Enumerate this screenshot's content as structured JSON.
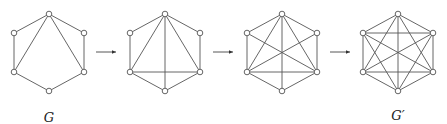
{
  "diagram": {
    "vertex_offsets": {
      "top": [
        0,
        -39
      ],
      "ul": [
        -35,
        -20
      ],
      "ll": [
        -35,
        19
      ],
      "bottom": [
        0,
        38
      ],
      "lr": [
        35,
        19
      ],
      "ur": [
        35,
        -20
      ]
    },
    "graphs": [
      {
        "id": "G",
        "label": "G",
        "center": [
          49,
          53
        ],
        "edges": [
          [
            "top",
            "ul"
          ],
          [
            "ul",
            "ll"
          ],
          [
            "ll",
            "bottom"
          ],
          [
            "bottom",
            "lr"
          ],
          [
            "lr",
            "ur"
          ],
          [
            "ur",
            "top"
          ],
          [
            "top",
            "ll"
          ],
          [
            "top",
            "lr"
          ]
        ]
      },
      {
        "id": "step1",
        "label": "",
        "center": [
          165,
          53
        ],
        "edges": [
          [
            "top",
            "ul"
          ],
          [
            "ul",
            "ll"
          ],
          [
            "ll",
            "bottom"
          ],
          [
            "bottom",
            "lr"
          ],
          [
            "lr",
            "ur"
          ],
          [
            "ur",
            "top"
          ],
          [
            "top",
            "ll"
          ],
          [
            "top",
            "lr"
          ],
          [
            "top",
            "bottom"
          ],
          [
            "ll",
            "lr"
          ]
        ]
      },
      {
        "id": "step2",
        "label": "",
        "center": [
          282,
          53
        ],
        "edges": [
          [
            "top",
            "ul"
          ],
          [
            "ul",
            "ll"
          ],
          [
            "ll",
            "bottom"
          ],
          [
            "bottom",
            "lr"
          ],
          [
            "lr",
            "ur"
          ],
          [
            "ur",
            "top"
          ],
          [
            "top",
            "ll"
          ],
          [
            "top",
            "lr"
          ],
          [
            "top",
            "bottom"
          ],
          [
            "ll",
            "lr"
          ],
          [
            "ul",
            "lr"
          ],
          [
            "ur",
            "ll"
          ]
        ]
      },
      {
        "id": "G_prime",
        "label": "G′",
        "center": [
          398,
          53
        ],
        "edges": [
          [
            "top",
            "ul"
          ],
          [
            "ul",
            "ll"
          ],
          [
            "ll",
            "bottom"
          ],
          [
            "bottom",
            "lr"
          ],
          [
            "lr",
            "ur"
          ],
          [
            "ur",
            "top"
          ],
          [
            "top",
            "ll"
          ],
          [
            "top",
            "lr"
          ],
          [
            "top",
            "bottom"
          ],
          [
            "ll",
            "lr"
          ],
          [
            "ul",
            "lr"
          ],
          [
            "ur",
            "ll"
          ],
          [
            "ul",
            "ur"
          ],
          [
            "ul",
            "bottom"
          ],
          [
            "ur",
            "bottom"
          ]
        ]
      }
    ],
    "arrows": [
      {
        "from": [
          96,
          52
        ],
        "to": [
          116,
          52
        ]
      },
      {
        "from": [
          213,
          52
        ],
        "to": [
          233,
          52
        ]
      },
      {
        "from": [
          330,
          52
        ],
        "to": [
          350,
          52
        ]
      }
    ],
    "labels": [
      {
        "text": "G",
        "x": 49,
        "y": 110
      },
      {
        "text": "G′",
        "x": 398,
        "y": 108
      }
    ]
  }
}
